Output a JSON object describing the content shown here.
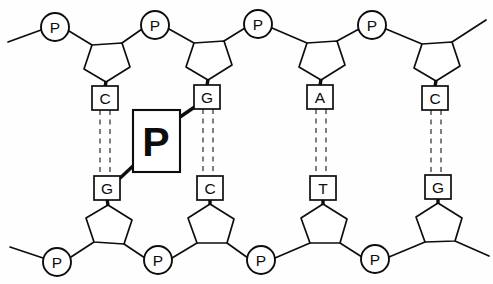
{
  "figure": {
    "background_color": "#fefefe",
    "line_color": "#0d0d0d",
    "hbond_color": "#3a3a3a"
  },
  "callout": {
    "label": "P",
    "name": "phosphate-callout",
    "box": {
      "x": 133,
      "y": 110,
      "w": 47,
      "h": 62
    }
  },
  "strands": {
    "top": {
      "name": "top-strand",
      "phosphates": [
        {
          "label": "P",
          "cx": 55,
          "cy": 27
        },
        {
          "label": "P",
          "cx": 155,
          "cy": 25
        },
        {
          "label": "P",
          "cx": 258,
          "cy": 24
        },
        {
          "label": "P",
          "cx": 372,
          "cy": 25
        }
      ],
      "sugars": [
        {
          "cx": 105,
          "cy": 55
        },
        {
          "cx": 207,
          "cy": 53
        },
        {
          "cx": 320,
          "cy": 53
        },
        {
          "cx": 435,
          "cy": 54
        }
      ],
      "bases": [
        {
          "label": "C",
          "cx": 105,
          "cy": 98
        },
        {
          "label": "G",
          "cx": 207,
          "cy": 96
        },
        {
          "label": "A",
          "cx": 320,
          "cy": 96
        },
        {
          "label": "C",
          "cx": 435,
          "cy": 97
        }
      ],
      "terminal_left": {
        "x1": 8,
        "y1": 42,
        "x2": 40,
        "y2": 29
      },
      "terminal_right": {
        "x1": 455,
        "y1": 44,
        "x2": 486,
        "y2": 20
      }
    },
    "bottom": {
      "name": "bottom-strand",
      "phosphates": [
        {
          "label": "P",
          "cx": 57,
          "cy": 262
        },
        {
          "label": "P",
          "cx": 158,
          "cy": 260
        },
        {
          "label": "P",
          "cx": 261,
          "cy": 260
        },
        {
          "label": "P",
          "cx": 375,
          "cy": 259
        }
      ],
      "sugars": [
        {
          "cx": 107,
          "cy": 230
        },
        {
          "cx": 210,
          "cy": 230
        },
        {
          "cx": 323,
          "cy": 230
        },
        {
          "cx": 438,
          "cy": 229
        }
      ],
      "bases": [
        {
          "label": "G",
          "cx": 107,
          "cy": 188
        },
        {
          "label": "C",
          "cx": 210,
          "cy": 188
        },
        {
          "label": "T",
          "cx": 323,
          "cy": 188
        },
        {
          "label": "G",
          "cx": 438,
          "cy": 187
        }
      ],
      "terminal_left": {
        "x1": 10,
        "y1": 247,
        "x2": 42,
        "y2": 259
      },
      "terminal_right": {
        "x1": 458,
        "y1": 243,
        "x2": 489,
        "y2": 256
      }
    }
  },
  "base_pairs": [
    {
      "top": "C",
      "bottom": "G",
      "x": 105,
      "bonds": 2
    },
    {
      "top": "G",
      "bottom": "C",
      "x": 208,
      "bonds": 2
    },
    {
      "top": "A",
      "bottom": "T",
      "x": 321,
      "bonds": 2
    },
    {
      "top": "C",
      "bottom": "G",
      "x": 436,
      "bonds": 2
    }
  ],
  "base_pair_geometry": {
    "y_top": 110,
    "y_bottom": 176,
    "offset": 5
  }
}
